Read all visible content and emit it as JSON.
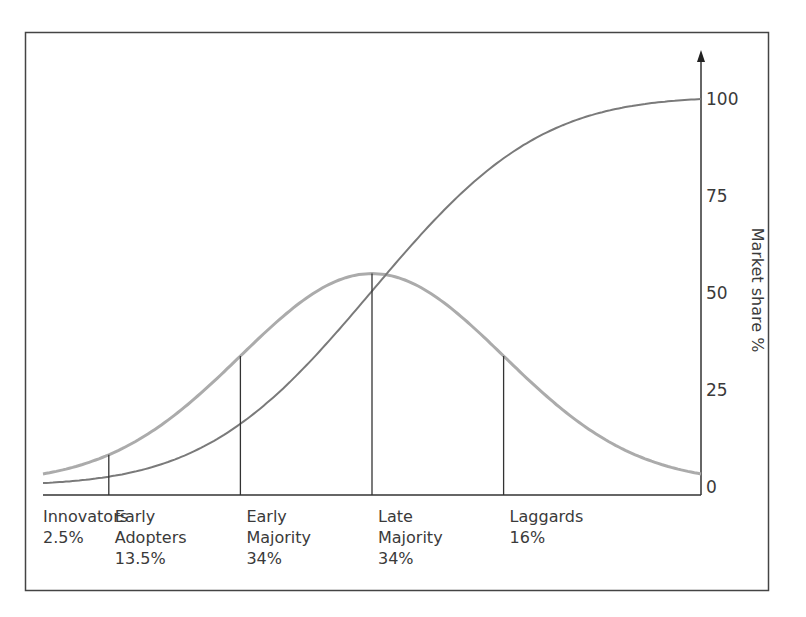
{
  "chart_data": {
    "type": "line",
    "title": "",
    "xlabel": "",
    "ylabel": "Market share %",
    "ylim": [
      0,
      100
    ],
    "y_ticks": [
      "0",
      "25",
      "50",
      "75",
      "100"
    ],
    "y_axis_side": "right",
    "grid": false,
    "segments": [
      {
        "name": "Innovators",
        "label_lines": [
          "Innovators",
          "2.5%"
        ],
        "share": 2.5,
        "boundary_sd": -2
      },
      {
        "name": "Early Adopters",
        "label_lines": [
          "Early",
          "Adopters",
          "13.5%"
        ],
        "share": 13.5,
        "boundary_sd": -1
      },
      {
        "name": "Early Majority",
        "label_lines": [
          "Early",
          "Majority",
          "34%"
        ],
        "share": 34,
        "boundary_sd": 0
      },
      {
        "name": "Late Majority",
        "label_lines": [
          "Late",
          "Majority",
          "34%"
        ],
        "share": 34,
        "boundary_sd": 1
      },
      {
        "name": "Laggards",
        "label_lines": [
          "Laggards",
          "16%"
        ],
        "share": 16,
        "boundary_sd": null
      }
    ],
    "series": [
      {
        "name": "Adoption (bell curve)",
        "kind": "normal_pdf",
        "peak_value": 55,
        "color": "#ababab"
      },
      {
        "name": "Cumulative market share (S-curve)",
        "kind": "normal_cdf",
        "max_value": 100,
        "color": "#7a7a7a"
      }
    ],
    "x_range_sd": [
      -2.5,
      2.5
    ]
  },
  "colors": {
    "axis": "#333333",
    "frame": "#444444",
    "bell": "#ababab",
    "scurve": "#7a7a7a"
  }
}
